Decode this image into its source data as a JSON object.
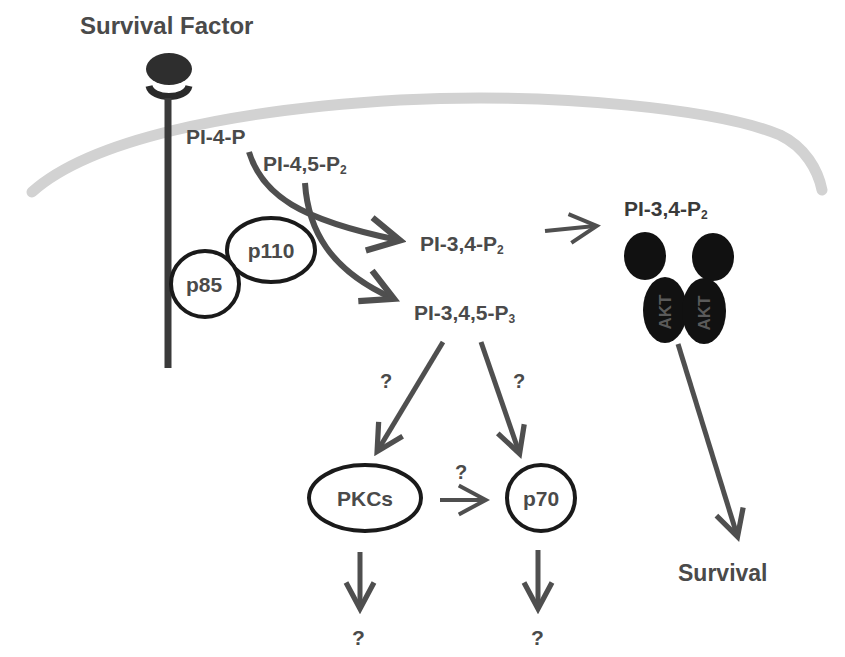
{
  "title": "Survival Factor",
  "colors": {
    "membrane": "#d2d2d2",
    "arrow": "#4f4f4f",
    "text": "#474747",
    "akt_fill": "#111111",
    "outline": "#1a1a1a"
  },
  "nodes": {
    "survival_factor": "Survival Factor",
    "pi4p": "PI-4-P",
    "pi45p2": {
      "base": "PI-4,5-P",
      "sub": "2"
    },
    "p110": "p110",
    "p85": "p85",
    "pi34p2": {
      "base": "PI-3,4-P",
      "sub": "2"
    },
    "pi345p3": {
      "base": "PI-3,4,5-P",
      "sub": "3"
    },
    "pi34p2_akt": {
      "base": "PI-3,4-P",
      "sub": "2"
    },
    "akt_left": "AKT",
    "akt_right": "AKT",
    "pkcs": "PKCs",
    "p70": "p70",
    "survival": "Survival"
  },
  "unknowns": {
    "to_pkcs": "?",
    "to_p70": "?",
    "pkcs_to_p70": "?",
    "pkcs_down": "?",
    "p70_down": "?"
  },
  "edges": [
    {
      "from": "PI-4-P",
      "to": "PI-3,4-P2"
    },
    {
      "from": "PI-4,5-P2",
      "to": "PI-3,4,5-P3"
    },
    {
      "from": "PI-3,4-P2",
      "to": "PI-3,4-P2 (AKT)"
    },
    {
      "from": "PI-3,4,5-P3",
      "to": "PKCs",
      "label": "?"
    },
    {
      "from": "PI-3,4,5-P3",
      "to": "p70",
      "label": "?"
    },
    {
      "from": "PKCs",
      "to": "p70",
      "label": "?"
    },
    {
      "from": "PKCs",
      "to": "?"
    },
    {
      "from": "p70",
      "to": "?"
    },
    {
      "from": "AKT",
      "to": "Survival"
    }
  ]
}
